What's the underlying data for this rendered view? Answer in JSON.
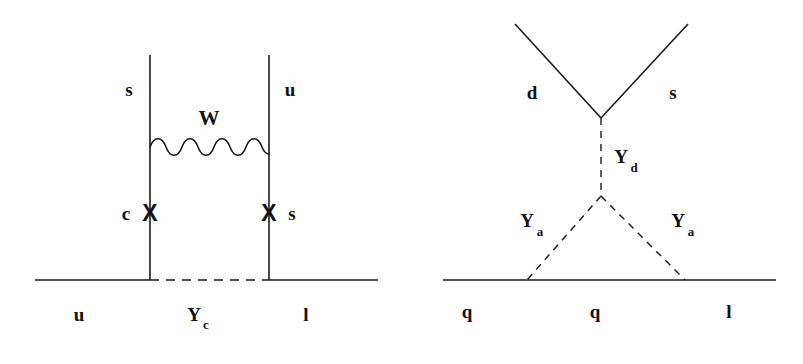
{
  "figure": {
    "kind": "feynman-diagrams",
    "background_color": "#ffffff",
    "line_color": "#1a1a1a",
    "panel_count": 2
  },
  "left_diagram": {
    "name": "box-diagram-W-exchange",
    "labels": {
      "top_left_quark": "s",
      "top_right_quark": "u",
      "boson": "W",
      "left_mid_quark": "c",
      "right_mid_quark": "s",
      "bottom_left": "u",
      "bottom_middle_main": "Y",
      "bottom_middle_sub": "c",
      "bottom_right": "l"
    },
    "mass_insertions": [
      "X",
      "X"
    ],
    "geometry": {
      "left_rail_x": 150,
      "right_rail_x": 269,
      "rail_top_y": 55,
      "baseline_y": 280,
      "baseline_x_start": 35,
      "baseline_x_end": 378,
      "wavy_y": 145,
      "insertion_y": 213
    }
  },
  "right_diagram": {
    "name": "penguin-triangle-diagram",
    "labels": {
      "incoming_left": "d",
      "incoming_right": "s",
      "vertical_propagator_main": "Y",
      "vertical_propagator_sub": "d",
      "left_leg_main": "Y",
      "left_leg_sub": "a",
      "right_leg_main": "Y",
      "right_leg_sub": "a",
      "bottom_left": "q",
      "bottom_middle": "q",
      "bottom_right": "l"
    },
    "geometry": {
      "apex_x": 601,
      "apex_y": 118,
      "upper_left_x": 515,
      "upper_left_y": 24,
      "upper_right_x": 688,
      "upper_right_y": 24,
      "lower_vertex_x": 601,
      "lower_vertex_y": 196,
      "baseline_left_contact_x": 527,
      "baseline_right_contact_x": 685,
      "baseline_y": 280,
      "baseline_x_start": 443,
      "baseline_x_end": 776
    }
  }
}
